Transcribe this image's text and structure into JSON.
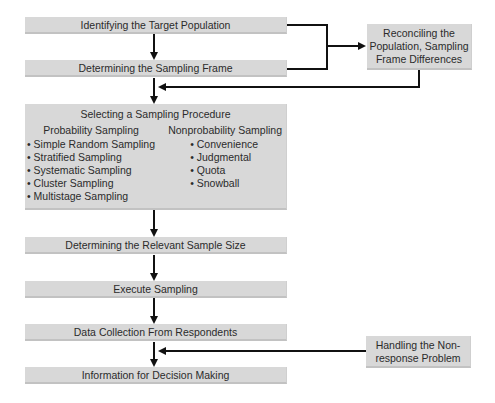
{
  "flow": {
    "steps": [
      {
        "id": "target",
        "label": "Identifying the Target Population"
      },
      {
        "id": "frame",
        "label": "Determining the Sampling Frame"
      },
      {
        "id": "procedure",
        "label": "Selecting a Sampling Procedure"
      },
      {
        "id": "size",
        "label": "Determining the Relevant Sample Size"
      },
      {
        "id": "execute",
        "label": "Execute Sampling"
      },
      {
        "id": "collect",
        "label": "Data Collection From Respondents"
      },
      {
        "id": "info",
        "label": "Information for Decision Making"
      }
    ],
    "procedure": {
      "probability": {
        "heading": "Probability Sampling",
        "items": [
          "Simple Random Sampling",
          "Stratified Sampling",
          "Systematic Sampling",
          "Cluster Sampling",
          "Multistage Sampling"
        ]
      },
      "nonprobability": {
        "heading": "Nonprobability Sampling",
        "items": [
          "Convenience",
          "Judgmental",
          "Quota",
          "Snowball"
        ]
      }
    },
    "side_boxes": {
      "reconcile": {
        "line1": "Reconciling the",
        "line2": "Population, Sampling",
        "line3": "Frame Differences"
      },
      "nonresponse": {
        "line1": "Handling the Non-",
        "line2": "response Problem"
      }
    }
  },
  "colors": {
    "box_fill": "#d8d8d8",
    "arrow": "#111111",
    "text": "#2b2b2b"
  }
}
